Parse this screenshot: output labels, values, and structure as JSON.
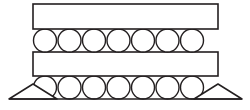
{
  "figure": {
    "background_color": "#ffffff",
    "line_color": "#231f20",
    "fill_color": "#ffffff",
    "canvas": {
      "width": 250,
      "height": 110
    }
  },
  "chart_data": {
    "type": "diagram",
    "elements": [
      {
        "name": "top-plate",
        "shape": "rectangle",
        "x": 33,
        "y": 4,
        "width": 185,
        "height": 25
      },
      {
        "name": "middle-plate",
        "shape": "rectangle",
        "x": 33,
        "y": 52,
        "width": 185,
        "height": 24
      }
    ],
    "roller_rows": [
      {
        "name": "upper-roller-row",
        "count": 7,
        "radius": 11.5,
        "center_y": 40.5,
        "first_center_x": 45,
        "spacing": 24.5
      },
      {
        "name": "lower-roller-row",
        "count": 7,
        "radius": 11.5,
        "center_y": 87.5,
        "first_center_x": 45,
        "spacing": 24.5
      }
    ],
    "supports": [
      {
        "name": "left-support",
        "shape": "triangle",
        "apex_x": 33,
        "apex_y": 84,
        "base_left_x": 9,
        "base_right_x": 57,
        "base_y": 99
      },
      {
        "name": "right-support",
        "shape": "triangle",
        "apex_x": 218,
        "apex_y": 84,
        "base_left_x": 194,
        "base_right_x": 242,
        "base_y": 99
      }
    ],
    "ground_line": {
      "name": "ground-line",
      "x1": 9,
      "y1": 99,
      "x2": 242,
      "y2": 99
    }
  }
}
